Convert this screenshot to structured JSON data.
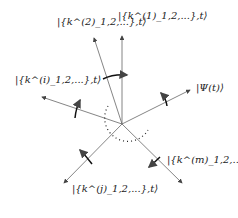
{
  "labels": {
    "k1": "|{k^(1)_1,2,...},t⟩",
    "k2": "|{k^(2)_1,2,...},t⟩",
    "ki": "|{k^(i)_1,2,...},t⟩",
    "psi": "|Ψ(t)⟩",
    "kj": "|{k^(j)_1,2,...},t⟩",
    "km": "|{k^(m)_1,2,...},t⟩"
  },
  "colors": {
    "line": "#555555",
    "text": "#222222"
  }
}
